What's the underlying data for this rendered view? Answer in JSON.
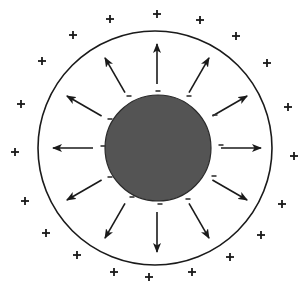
{
  "diagram": {
    "title": "",
    "width": 306,
    "height": 291,
    "background": "#ffffff",
    "colors": {
      "ink": "#1a1a1a",
      "core_fill": "#545454",
      "core_stroke": "#2a2a2a"
    },
    "outer_boundary": {
      "cx": 155,
      "cy": 148,
      "r": 117,
      "stroke_width": 1.6
    },
    "core": {
      "cx": 158,
      "cy": 148,
      "r": 53
    },
    "arrows": {
      "count": 12,
      "center": [
        157,
        148
      ],
      "start_radius": 64,
      "end_radius": 104,
      "angles_deg": [
        -90,
        -60,
        -30,
        0,
        30,
        60,
        90,
        120,
        150,
        180,
        210,
        240
      ]
    },
    "negative_charges": {
      "symbol": "-",
      "points": [
        [
          158,
          91
        ],
        [
          189,
          96
        ],
        [
          215,
          115
        ],
        [
          221,
          145
        ],
        [
          214,
          176
        ],
        [
          188,
          199
        ],
        [
          160,
          204
        ],
        [
          132,
          197
        ],
        [
          110,
          177
        ],
        [
          103,
          146
        ],
        [
          110,
          119
        ],
        [
          129,
          96
        ]
      ]
    },
    "positive_charges": {
      "symbol": "+",
      "points": [
        [
          157,
          14
        ],
        [
          200,
          20
        ],
        [
          236,
          36
        ],
        [
          267,
          63
        ],
        [
          288,
          107
        ],
        [
          294,
          156
        ],
        [
          282,
          204
        ],
        [
          261,
          235
        ],
        [
          230,
          257
        ],
        [
          192,
          272
        ],
        [
          149,
          277
        ],
        [
          114,
          272
        ],
        [
          77,
          255
        ],
        [
          46,
          233
        ],
        [
          25,
          201
        ],
        [
          15,
          152
        ],
        [
          21,
          104
        ],
        [
          42,
          61
        ],
        [
          73,
          35
        ],
        [
          110,
          19
        ]
      ]
    }
  }
}
